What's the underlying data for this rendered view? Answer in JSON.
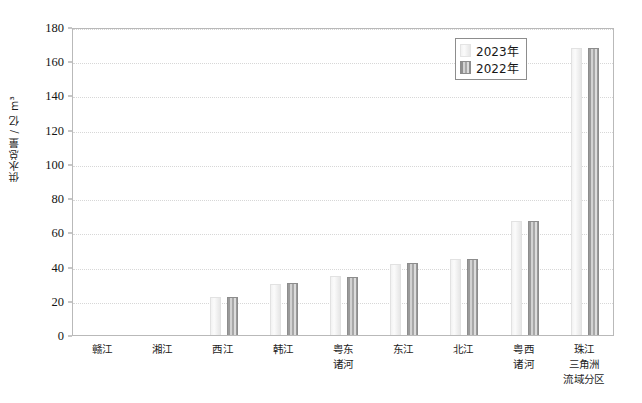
{
  "chart_data": {
    "type": "bar",
    "title": "",
    "xlabel": "流域分区",
    "ylabel": "供水总量 / 亿 m³",
    "ylim": [
      0,
      180
    ],
    "yticks": [
      0,
      20,
      40,
      60,
      80,
      100,
      120,
      140,
      160,
      180
    ],
    "grid": true,
    "legend_position": "top-right",
    "categories": [
      "赣江",
      "湘江",
      "西江",
      "韩江",
      "粤东诸河",
      "东江",
      "北江",
      "粤西诸河",
      "珠江三角洲"
    ],
    "category_lines": [
      [
        "赣江"
      ],
      [
        "湘江"
      ],
      [
        "西江"
      ],
      [
        "韩江"
      ],
      [
        "粤东",
        "诸河"
      ],
      [
        "东江"
      ],
      [
        "北江"
      ],
      [
        "粤西",
        "诸河"
      ],
      [
        "珠江",
        "三角洲"
      ]
    ],
    "series": [
      {
        "name": "2023年",
        "color": "#f2f2f2",
        "values": [
          0.4,
          0.5,
          22.0,
          30.0,
          34.5,
          41.5,
          44.5,
          66.5,
          167.5
        ]
      },
      {
        "name": "2022年",
        "color": "#9a9a9a",
        "values": [
          0.4,
          0.5,
          22.5,
          30.5,
          34.0,
          42.0,
          44.5,
          66.5,
          167.5
        ]
      }
    ]
  },
  "legend": {
    "items": [
      {
        "label": "2023年",
        "swatch": "y2023"
      },
      {
        "label": "2022年",
        "swatch": "y2022"
      }
    ]
  },
  "axis": {
    "y_title": "供水总量 / 亿 m³",
    "x_title": "流域分区"
  }
}
